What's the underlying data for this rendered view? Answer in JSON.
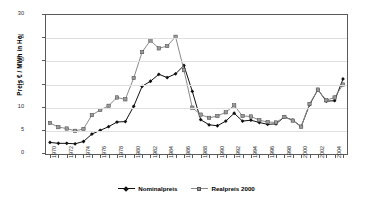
{
  "chart_data": {
    "type": "line",
    "title": "",
    "xlabel": "",
    "ylabel": "Preis € / MWh in Ho",
    "ylim": [
      0,
      30
    ],
    "yticks": [
      0,
      5,
      10,
      15,
      20,
      25,
      30
    ],
    "grid": true,
    "legend_position": "bottom",
    "x": [
      1970,
      1971,
      1972,
      1973,
      1974,
      1975,
      1976,
      1977,
      1978,
      1979,
      1980,
      1981,
      1982,
      1983,
      1984,
      1985,
      1986,
      1987,
      1988,
      1989,
      1990,
      1991,
      1992,
      1993,
      1994,
      1995,
      1996,
      1997,
      1998,
      1999,
      2000,
      2001,
      2002,
      2003,
      2004,
      2005
    ],
    "xtick_labels": [
      "1970",
      "1972",
      "1974",
      "1976",
      "1978",
      "1980",
      "1982",
      "1984",
      "1986",
      "1988",
      "1990",
      "1992",
      "1994",
      "1996",
      "1998",
      "2000",
      "2002",
      "2004"
    ],
    "series": [
      {
        "name": "Nominalpreis",
        "color": "#111111",
        "marker": "diamond",
        "values": [
          2.5,
          2.3,
          2.3,
          2.2,
          2.7,
          4.3,
          5.1,
          5.9,
          6.9,
          7.0,
          10.3,
          14.6,
          15.7,
          17.2,
          16.5,
          17.3,
          19.1,
          13.5,
          7.4,
          6.3,
          6.1,
          7.1,
          8.8,
          7.1,
          7.3,
          6.8,
          6.4,
          6.5,
          8.0,
          7.3,
          5.9,
          10.6,
          13.9,
          11.4,
          11.5,
          16.2
        ]
      },
      {
        "name": "Realpreis 2000",
        "color": "#8a8a8a",
        "marker": "square",
        "values": [
          6.7,
          5.8,
          5.5,
          5.0,
          5.4,
          8.4,
          9.5,
          10.4,
          12.2,
          11.8,
          16.4,
          22.0,
          24.5,
          22.8,
          23.3,
          25.3,
          18.1,
          10.0,
          8.5,
          7.8,
          8.2,
          9.0,
          10.5,
          8.2,
          8.1,
          7.3,
          6.9,
          6.8,
          8.0,
          7.2,
          5.9,
          10.8,
          13.9,
          11.6,
          12.2,
          15.0
        ]
      }
    ]
  },
  "legend": {
    "entries": [
      {
        "label": "Nominalpreis"
      },
      {
        "label": "Realpreis 2000"
      }
    ]
  }
}
